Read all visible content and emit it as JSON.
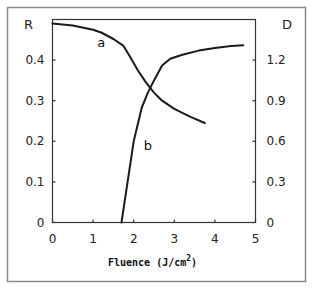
{
  "chart_data": {
    "type": "line",
    "title": "",
    "xlabel": "Fluence (J/cm2)",
    "xlabel_base": "Fluence (J/cm",
    "xlabel_sup": "2",
    "xlabel_close": ")",
    "ylabel_left": "R",
    "ylabel_right": "D",
    "xlim": [
      0,
      5
    ],
    "ylim_left": [
      0,
      0.5
    ],
    "ylim_right": [
      0,
      1.5
    ],
    "x_ticks": [
      "0",
      "1",
      "2",
      "3",
      "4",
      "5"
    ],
    "y_ticks_left": [
      "0",
      "0.1",
      "0.2",
      "0.3",
      "0.4"
    ],
    "y_ticks_right": [
      "0",
      "0.3",
      "0.6",
      "0.9",
      "1.2"
    ],
    "grid": false,
    "legend": "none (curves labeled inline 'a' and 'b')",
    "series": [
      {
        "name": "a",
        "axis": "left",
        "x": [
          0,
          0.5,
          1.0,
          1.2,
          1.5,
          1.75,
          1.9,
          2.1,
          2.3,
          2.5,
          2.7,
          3.0,
          3.4,
          3.75
        ],
        "values": [
          0.49,
          0.485,
          0.475,
          0.468,
          0.452,
          0.435,
          0.41,
          0.375,
          0.345,
          0.32,
          0.3,
          0.28,
          0.26,
          0.245
        ]
      },
      {
        "name": "b",
        "axis": "right",
        "x": [
          1.7,
          1.85,
          2.0,
          2.2,
          2.35,
          2.5,
          2.7,
          2.9,
          3.2,
          3.6,
          4.0,
          4.4,
          4.7
        ],
        "values": [
          0,
          0.3,
          0.6,
          0.85,
          0.96,
          1.05,
          1.16,
          1.21,
          1.24,
          1.27,
          1.29,
          1.305,
          1.31
        ]
      }
    ],
    "annotations": [
      {
        "text": "a",
        "x": 1.1,
        "y_left": 0.445
      },
      {
        "text": "b",
        "x": 2.25,
        "y_left": 0.19
      }
    ]
  },
  "colors": {
    "line": "#1a1a1a",
    "axis": "#333333",
    "frame": "#888888",
    "background": "#ffffff"
  }
}
